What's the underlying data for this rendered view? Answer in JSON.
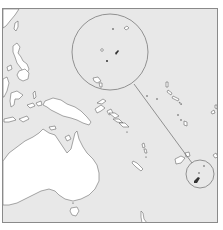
{
  "map": {
    "type": "locator-map",
    "region": "Western Pacific / Oceania",
    "colors": {
      "ocean": "#e8e8e8",
      "land": "#ffffff",
      "coastline": "#6d6d6d",
      "frame": "#8a8a8a",
      "highlight_fill": "#333333"
    },
    "features": [
      {
        "name": "australia",
        "label": ""
      },
      {
        "name": "new-guinea",
        "label": ""
      },
      {
        "name": "philippines",
        "label": ""
      },
      {
        "name": "solomon-islands",
        "label": ""
      },
      {
        "name": "vanuatu",
        "label": ""
      },
      {
        "name": "fiji",
        "label": ""
      },
      {
        "name": "tasmania",
        "label": ""
      }
    ],
    "inset": {
      "enlarged_circle": {
        "cx": 109,
        "cy": 51,
        "r": 38
      },
      "source_circle": {
        "cx": 199,
        "cy": 173,
        "r": 14
      }
    }
  }
}
